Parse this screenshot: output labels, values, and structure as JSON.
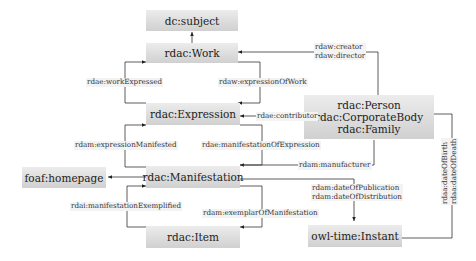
{
  "nodes": {
    "subject": "dc:subject",
    "work": "rdac:Work",
    "expression": "rdac:Expression",
    "manifestation": "rdac:Manifestation",
    "item": "rdac:Item",
    "homepage": "foaf:homepage",
    "agent": [
      "rdac:Person",
      "rdac:CorporateBody",
      "rdac:Family"
    ],
    "instant": "owl-time:Instant"
  },
  "edges": {
    "creator": [
      "rdaw:creator",
      "rdaw:director"
    ],
    "work_expressed": "rdae:workExpressed",
    "expression_of_work": "rdaw:expressionOfWork",
    "contributor": "rdae:contributor",
    "expression_manifested": "rdam:expressionManifested",
    "manifestation_of_expression": "rdae:manifestationOfExpression",
    "manufacturer": "rdam:manufacturer",
    "dates_pub": [
      "rdam:dateOfPublication",
      "rdam:dateOfDistribution"
    ],
    "manifestation_exemplified": "rdai:manifestationExemplified",
    "exemplar_of_manifestation": "rdam:exemplarOfManifestation",
    "dates_life": [
      "rdaa:dateOfBirth",
      "rdaa:dateOfDeath"
    ]
  }
}
